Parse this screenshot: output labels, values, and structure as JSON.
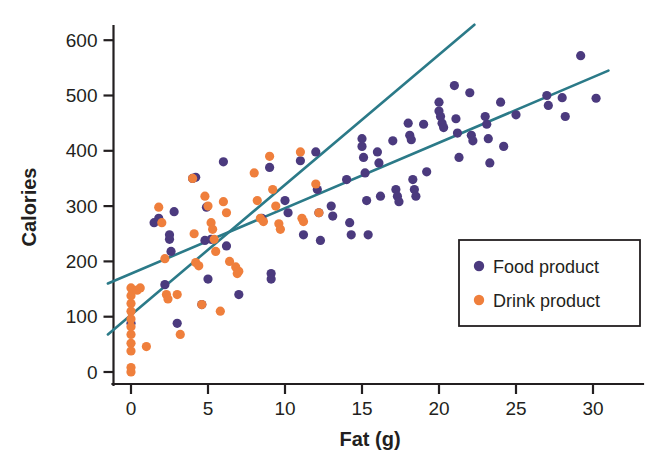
{
  "chart_data": {
    "type": "scatter",
    "title": "",
    "xlabel": "Fat (g)",
    "ylabel": "Calories",
    "xlim": [
      -1.6,
      32.0
    ],
    "ylim": [
      -35,
      650
    ],
    "xticks": [
      0,
      5,
      10,
      15,
      20,
      25,
      30
    ],
    "xtick_labels": [
      "0",
      "5",
      "10",
      "15",
      "20",
      "25",
      "30"
    ],
    "yticks": [
      0,
      100,
      200,
      300,
      400,
      500,
      600
    ],
    "ytick_labels": [
      "0",
      "100",
      "200",
      "300",
      "400",
      "500",
      "600"
    ],
    "grid": false,
    "legend_position": "lower-right",
    "colors": {
      "food": "#4b3a7e",
      "drink": "#ef7f3c",
      "trendline": "#2b7a88",
      "axis": "#231f20",
      "background": "#ffffff"
    },
    "marker_radius_px": 4.6,
    "series": [
      {
        "name": "Food product",
        "color": "#4b3a7e",
        "points": [
          [
            0,
            88
          ],
          [
            1.5,
            270
          ],
          [
            1.8,
            278
          ],
          [
            2.2,
            158
          ],
          [
            2.5,
            240
          ],
          [
            2.5,
            248
          ],
          [
            2.6,
            218
          ],
          [
            2.8,
            290
          ],
          [
            3.0,
            88
          ],
          [
            4.0,
            350
          ],
          [
            4.2,
            352
          ],
          [
            4.6,
            122
          ],
          [
            4.8,
            238
          ],
          [
            4.9,
            298
          ],
          [
            5.0,
            168
          ],
          [
            5.2,
            240
          ],
          [
            6.0,
            380
          ],
          [
            6.2,
            228
          ],
          [
            7.0,
            140
          ],
          [
            8.5,
            278
          ],
          [
            9.0,
            370
          ],
          [
            9.1,
            178
          ],
          [
            9.1,
            168
          ],
          [
            10.0,
            310
          ],
          [
            10.2,
            288
          ],
          [
            11.0,
            382
          ],
          [
            11.2,
            248
          ],
          [
            12.0,
            398
          ],
          [
            12.1,
            330
          ],
          [
            12.2,
            288
          ],
          [
            12.3,
            238
          ],
          [
            13.0,
            300
          ],
          [
            13.1,
            282
          ],
          [
            14.0,
            348
          ],
          [
            14.2,
            270
          ],
          [
            14.3,
            248
          ],
          [
            15.0,
            422
          ],
          [
            15.0,
            408
          ],
          [
            15.1,
            388
          ],
          [
            15.2,
            360
          ],
          [
            15.3,
            310
          ],
          [
            15.4,
            248
          ],
          [
            16.0,
            398
          ],
          [
            16.1,
            378
          ],
          [
            16.2,
            318
          ],
          [
            17.0,
            418
          ],
          [
            17.2,
            330
          ],
          [
            17.3,
            318
          ],
          [
            17.4,
            308
          ],
          [
            18.0,
            450
          ],
          [
            18.1,
            428
          ],
          [
            18.2,
            420
          ],
          [
            18.3,
            348
          ],
          [
            18.4,
            330
          ],
          [
            18.5,
            318
          ],
          [
            19.0,
            448
          ],
          [
            19.2,
            362
          ],
          [
            20.0,
            488
          ],
          [
            20.0,
            472
          ],
          [
            20.1,
            462
          ],
          [
            20.2,
            450
          ],
          [
            20.3,
            442
          ],
          [
            21.0,
            518
          ],
          [
            21.1,
            458
          ],
          [
            21.2,
            432
          ],
          [
            21.3,
            388
          ],
          [
            22.0,
            505
          ],
          [
            22.1,
            428
          ],
          [
            22.2,
            418
          ],
          [
            23.0,
            462
          ],
          [
            23.1,
            448
          ],
          [
            23.2,
            422
          ],
          [
            23.3,
            378
          ],
          [
            24.0,
            488
          ],
          [
            24.2,
            408
          ],
          [
            25.0,
            465
          ],
          [
            27.0,
            500
          ],
          [
            27.1,
            482
          ],
          [
            28.0,
            496
          ],
          [
            28.2,
            462
          ],
          [
            29.2,
            572
          ],
          [
            30.2,
            495
          ]
        ]
      },
      {
        "name": "Drink product",
        "color": "#ef7f3c",
        "points": [
          [
            0,
            0
          ],
          [
            0,
            8
          ],
          [
            0,
            38
          ],
          [
            0,
            52
          ],
          [
            0,
            68
          ],
          [
            0,
            82
          ],
          [
            0,
            96
          ],
          [
            0,
            110
          ],
          [
            0,
            124
          ],
          [
            0,
            138
          ],
          [
            0,
            152
          ],
          [
            0.4,
            148
          ],
          [
            0.6,
            152
          ],
          [
            1.0,
            46
          ],
          [
            1.8,
            298
          ],
          [
            2.0,
            270
          ],
          [
            2.2,
            205
          ],
          [
            2.3,
            140
          ],
          [
            2.4,
            132
          ],
          [
            3.0,
            140
          ],
          [
            3.2,
            68
          ],
          [
            4.0,
            350
          ],
          [
            4.1,
            250
          ],
          [
            4.2,
            198
          ],
          [
            4.4,
            192
          ],
          [
            4.6,
            122
          ],
          [
            4.8,
            318
          ],
          [
            5.0,
            300
          ],
          [
            5.2,
            270
          ],
          [
            5.3,
            258
          ],
          [
            5.4,
            240
          ],
          [
            5.5,
            218
          ],
          [
            5.8,
            110
          ],
          [
            6.0,
            308
          ],
          [
            6.2,
            288
          ],
          [
            6.4,
            200
          ],
          [
            6.8,
            190
          ],
          [
            6.9,
            178
          ],
          [
            7.0,
            182
          ],
          [
            8.0,
            360
          ],
          [
            8.2,
            310
          ],
          [
            8.4,
            278
          ],
          [
            8.6,
            272
          ],
          [
            9.0,
            390
          ],
          [
            9.2,
            330
          ],
          [
            9.4,
            300
          ],
          [
            9.6,
            268
          ],
          [
            9.7,
            258
          ],
          [
            11.0,
            398
          ],
          [
            11.1,
            278
          ],
          [
            11.2,
            272
          ],
          [
            12.0,
            340
          ],
          [
            12.2,
            288
          ]
        ]
      }
    ],
    "trend_lines": [
      {
        "name": "Food product trend",
        "series": "Food product",
        "color": "#2b7a88",
        "x_start": -1.5,
        "y_start": 160,
        "x_end": 31.0,
        "y_end": 545
      },
      {
        "name": "Drink product trend",
        "series": "Drink product",
        "color": "#2b7a88",
        "x_start": -1.5,
        "y_start": 68,
        "x_end": 22.3,
        "y_end": 628
      }
    ],
    "legend_entries": [
      {
        "label": "Food product",
        "color": "#4b3a7e"
      },
      {
        "label": "Drink product",
        "color": "#ef7f3c"
      }
    ]
  }
}
